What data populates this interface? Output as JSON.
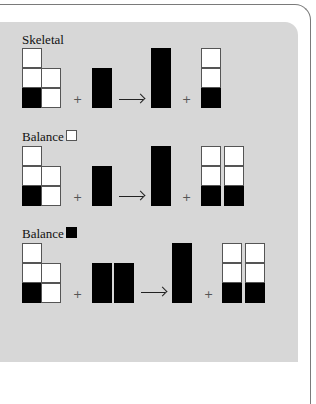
{
  "colors": {
    "panel": "#d7d7d7",
    "frame": "#7a7a7a",
    "filled": "#000000",
    "empty": "#ffffff"
  },
  "sections": [
    {
      "label": "Skeletal",
      "swatch": null,
      "reactant_blocks": 1,
      "product_columns": 1
    },
    {
      "label": "Balance",
      "swatch": "white-square",
      "reactant_blocks": 1,
      "product_columns": 2
    },
    {
      "label": "Balance",
      "swatch": "black-square",
      "reactant_blocks": 2,
      "product_columns": 2
    }
  ],
  "symbols": {
    "plus": "+"
  }
}
